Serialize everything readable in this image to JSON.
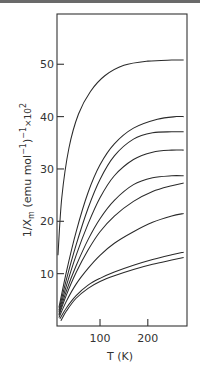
{
  "chart_data": {
    "type": "line",
    "title": "",
    "xlabel": "T (K)",
    "ylabel": "1/χm (emu mol⁻¹)⁻¹ × 10²",
    "ylabel_parts": {
      "main": "1/X",
      "sub": "m",
      "unit": " (emu mol",
      "sup": "−1",
      "close": ")",
      "sup2": "−1",
      "times": "×10",
      "exp": "2"
    },
    "xlim": [
      10,
      282
    ],
    "ylim": [
      0,
      59.6
    ],
    "x_ticks": [
      100,
      200
    ],
    "x_tick_labels": [
      "100",
      "200"
    ],
    "y_ticks": [
      10,
      20,
      30,
      40,
      50
    ],
    "y_tick_labels": [
      "10",
      "20",
      "30",
      "40",
      "50"
    ],
    "grid": false,
    "legend": null,
    "series": [
      {
        "name": "curve-1",
        "x": [
          12,
          20,
          35,
          55,
          80,
          110,
          150,
          200,
          250,
          275
        ],
        "y": [
          13.5,
          24.5,
          34.0,
          40.5,
          44.8,
          47.8,
          49.8,
          50.6,
          50.8,
          50.8
        ]
      },
      {
        "name": "curve-2",
        "x": [
          14,
          30,
          50,
          75,
          100,
          130,
          170,
          220,
          260,
          275
        ],
        "y": [
          3.5,
          10.5,
          18.0,
          25.5,
          30.8,
          34.8,
          37.8,
          39.5,
          40.0,
          40.0
        ]
      },
      {
        "name": "curve-3",
        "x": [
          14,
          30,
          50,
          75,
          100,
          130,
          170,
          210,
          250,
          275
        ],
        "y": [
          3.0,
          9.0,
          15.5,
          22.5,
          28.0,
          32.5,
          35.7,
          36.9,
          37.1,
          37.1
        ]
      },
      {
        "name": "curve-4",
        "x": [
          14,
          30,
          50,
          75,
          100,
          130,
          170,
          210,
          250,
          275
        ],
        "y": [
          2.6,
          7.8,
          13.5,
          19.5,
          24.5,
          28.7,
          31.8,
          33.2,
          33.6,
          33.6
        ]
      },
      {
        "name": "curve-5",
        "x": [
          14,
          30,
          50,
          75,
          100,
          130,
          170,
          210,
          250,
          275
        ],
        "y": [
          2.2,
          6.8,
          11.5,
          16.5,
          20.5,
          24.0,
          27.0,
          28.3,
          28.7,
          28.7
        ]
      },
      {
        "name": "curve-6",
        "x": [
          14,
          30,
          50,
          75,
          100,
          130,
          170,
          210,
          250,
          275
        ],
        "y": [
          2.0,
          6.0,
          10.2,
          14.5,
          18.0,
          21.0,
          23.8,
          25.7,
          26.8,
          27.3
        ]
      },
      {
        "name": "curve-7",
        "x": [
          14,
          30,
          50,
          75,
          100,
          130,
          170,
          210,
          250,
          275
        ],
        "y": [
          1.6,
          4.8,
          8.0,
          11.0,
          13.5,
          15.8,
          18.0,
          19.8,
          21.0,
          21.5
        ]
      },
      {
        "name": "curve-8",
        "x": [
          16,
          30,
          50,
          75,
          100,
          130,
          170,
          210,
          250,
          275
        ],
        "y": [
          1.4,
          3.5,
          5.8,
          7.8,
          9.1,
          10.3,
          11.6,
          12.7,
          13.6,
          14.1
        ]
      },
      {
        "name": "curve-9",
        "x": [
          18,
          30,
          50,
          75,
          100,
          130,
          170,
          210,
          250,
          275
        ],
        "y": [
          1.0,
          2.9,
          5.3,
          7.2,
          8.5,
          9.6,
          10.8,
          11.8,
          12.6,
          13.1
        ]
      }
    ]
  }
}
